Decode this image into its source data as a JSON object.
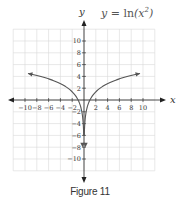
{
  "chart_data": {
    "type": "line",
    "xlabel": "x",
    "ylabel": "y",
    "xlim": [
      -12,
      12
    ],
    "ylim": [
      -12,
      12
    ],
    "grid": true,
    "x_ticks": [
      -10,
      -8,
      -6,
      -4,
      -2,
      2,
      4,
      6,
      8,
      10
    ],
    "y_ticks": [
      10,
      8,
      6,
      4,
      2,
      -2,
      -4,
      -6,
      -8,
      -10
    ],
    "series": [
      {
        "name": "y = ln(x²), x < 0",
        "x": [
          -9.5,
          -8,
          -6,
          -4,
          -2,
          -1,
          -0.5,
          -0.25,
          -0.1,
          -0.05
        ],
        "values": [
          4.5,
          4.16,
          3.58,
          2.77,
          1.39,
          0,
          -1.39,
          -2.77,
          -4.61,
          -5.99
        ]
      },
      {
        "name": "y = ln(x²), x > 0",
        "x": [
          0.05,
          0.1,
          0.25,
          0.5,
          1,
          2,
          4,
          6,
          8,
          9.5
        ],
        "values": [
          -5.99,
          -4.61,
          -2.77,
          -1.39,
          0,
          1.39,
          2.77,
          3.58,
          4.16,
          4.5
        ]
      }
    ],
    "annotations": [
      "both ends arrowed",
      "curves approach x = 0 as vertical asymptote"
    ]
  },
  "figure": {
    "caption": "Figure 11",
    "equation_prefix": "y = ",
    "equation_fn": "ln",
    "equation_arg": "(x",
    "equation_sup": "2",
    "equation_close": ")",
    "x_axis_label": "x",
    "y_axis_label": "y"
  },
  "colors": {
    "grid": "#d9d9d9",
    "axis": "#222222",
    "curve": "#555555",
    "text": "#333333"
  }
}
